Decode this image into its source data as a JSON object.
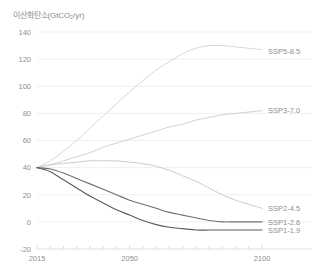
{
  "chart_data": {
    "type": "line",
    "title": "이산화탄소(GtCO₂/yr)",
    "xlabel": "",
    "ylabel": "이산화탄소(GtCO₂/yr)",
    "xlim": [
      2015,
      2100
    ],
    "ylim": [
      -20,
      140
    ],
    "grid": true,
    "legend_position": "right-inline",
    "y_ticks": [
      140,
      120,
      100,
      80,
      60,
      40,
      20,
      0,
      -20
    ],
    "y_tick_labels": [
      "140",
      "120",
      "100",
      "80",
      "60",
      "40",
      "20",
      "0",
      "-20"
    ],
    "x_ticks": [
      2015,
      2050,
      2100
    ],
    "x_tick_labels": [
      "2015",
      "2050",
      "2100"
    ],
    "x_minor_ticks": [
      2020,
      2025,
      2030,
      2035,
      2040,
      2045,
      2055,
      2060,
      2065,
      2070,
      2075,
      2080,
      2085,
      2090,
      2095
    ],
    "x": [
      2015,
      2020,
      2025,
      2030,
      2035,
      2040,
      2045,
      2050,
      2055,
      2060,
      2065,
      2070,
      2075,
      2080,
      2085,
      2090,
      2095,
      2100
    ],
    "series": [
      {
        "name": "SSP5-8.5",
        "label": "SSP5-8.5",
        "color": "#d5d5d5",
        "label_y": 126,
        "values": [
          40,
          45,
          52,
          60,
          69,
          78,
          87,
          96,
          104,
          112,
          118,
          124,
          128,
          130,
          130,
          129,
          128,
          127
        ]
      },
      {
        "name": "SSP3-7.0",
        "label": "SSP3-7.0",
        "color": "#d0d0d0",
        "label_y": 82,
        "values": [
          40,
          42,
          45,
          48,
          51,
          55,
          58,
          61,
          64,
          67,
          70,
          72,
          75,
          77,
          79,
          80,
          81,
          82
        ]
      },
      {
        "name": "SSP2-4.5",
        "label": "SSP2-4.5",
        "color": "#c8c8c8",
        "label_y": 10,
        "values": [
          40,
          42,
          43,
          44,
          45,
          45,
          45,
          44,
          43,
          41,
          38,
          34,
          30,
          25,
          20,
          16,
          13,
          10
        ]
      },
      {
        "name": "SSP1-2.6",
        "label": "SSP1-2.6",
        "color": "#6f6f6f",
        "label_y": 0,
        "values": [
          40,
          39,
          36,
          32,
          28,
          24,
          20,
          16,
          13,
          10,
          7,
          5,
          3,
          1,
          0,
          0,
          0,
          0
        ]
      },
      {
        "name": "SSP1-1.9",
        "label": "SSP1-1.9",
        "color": "#5c5c5c",
        "label_y": -6,
        "values": [
          40,
          37,
          31,
          25,
          19,
          14,
          9,
          5,
          1,
          -2,
          -4,
          -5,
          -6,
          -6,
          -6,
          -6,
          -6,
          -6
        ]
      }
    ]
  }
}
